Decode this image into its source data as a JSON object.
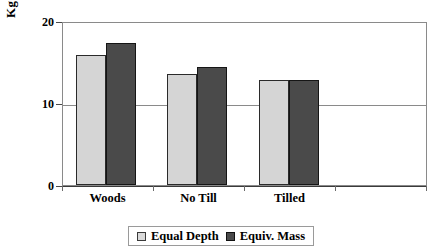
{
  "chart_data": {
    "type": "bar",
    "title": "",
    "xlabel": "",
    "ylabel": "Kg OC·m",
    "ylabel_exponent": "-3",
    "categories": [
      "Woods",
      "No Till",
      "Tilled",
      ""
    ],
    "series": [
      {
        "name": "Equal Depth",
        "color": "#d5d5d5",
        "values": [
          15.8,
          13.5,
          12.8,
          null
        ]
      },
      {
        "name": "Equiv. Mass",
        "color": "#4a4a4a",
        "values": [
          17.3,
          14.4,
          12.8,
          null
        ]
      }
    ],
    "ylim": [
      0,
      20
    ],
    "yticks": [
      0,
      10,
      20
    ],
    "ytick_labels": [
      "0",
      "10",
      "20"
    ],
    "grid": "horizontal-at-10",
    "legend_position": "bottom-center",
    "legend_entries": [
      "Equal Depth",
      "Equiv. Mass"
    ]
  },
  "axis": {
    "y_title": "Kg OC·m",
    "y_title_sup": "-3",
    "tick_0": "0",
    "tick_10": "10",
    "tick_20": "20"
  },
  "xaxis": {
    "labels": [
      "Woods",
      "No Till",
      "Tilled"
    ]
  },
  "legend": {
    "equal_depth": "Equal Depth",
    "equiv_mass": "Equiv. Mass"
  }
}
